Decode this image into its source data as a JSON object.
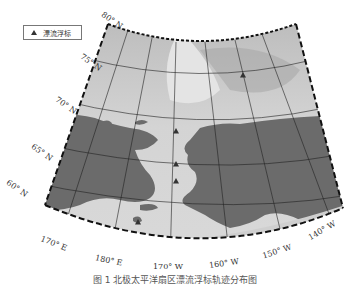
{
  "legend": {
    "marker_label": "漂流浮标"
  },
  "lat_labels": [
    {
      "text": "80° N",
      "x": 100,
      "y": 16,
      "rot": 35
    },
    {
      "text": "75° N",
      "x": 79,
      "y": 58,
      "rot": 35
    },
    {
      "text": "70° N",
      "x": 54,
      "y": 101,
      "rot": 35
    },
    {
      "text": "65° N",
      "x": 30,
      "y": 148,
      "rot": 35
    },
    {
      "text": "60° N",
      "x": 5,
      "y": 184,
      "rot": 35
    }
  ],
  "lon_labels": [
    {
      "text": "170° E",
      "x": 40,
      "y": 239,
      "rot": 22
    },
    {
      "text": "180° E",
      "x": 95,
      "y": 256,
      "rot": 12
    },
    {
      "text": "170° W",
      "x": 153,
      "y": 262,
      "rot": 0
    },
    {
      "text": "160° W",
      "x": 209,
      "y": 259,
      "rot": -8
    },
    {
      "text": "150° W",
      "x": 262,
      "y": 247,
      "rot": -18
    },
    {
      "text": "140° W",
      "x": 307,
      "y": 226,
      "rot": -30
    }
  ],
  "buoys": [
    {
      "x": 243,
      "y": 75
    },
    {
      "x": 176,
      "y": 131
    },
    {
      "x": 176,
      "y": 164
    },
    {
      "x": 176,
      "y": 181
    },
    {
      "x": 138,
      "y": 222
    }
  ],
  "caption": "图 1  北极太平洋扇区漂流浮标轨迹分布图",
  "colors": {
    "land": "#6b6b6b",
    "ice": "#c8c8c8",
    "water": "#dcdcdc",
    "grid": "#222222"
  }
}
